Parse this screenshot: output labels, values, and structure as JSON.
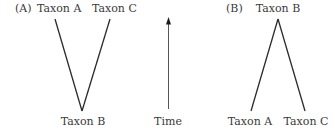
{
  "panel_a": {
    "label": "(A)",
    "top_left_taxon": "Taxon A",
    "top_right_taxon": "Taxon C",
    "bottom_taxon": "Taxon B"
  },
  "time_axis": {
    "label": "Time",
    "direction": "up"
  },
  "panel_b": {
    "label": "(B)",
    "top_taxon": "Taxon B",
    "bottom_left_taxon": "Taxon A",
    "bottom_right_taxon": "Taxon C"
  },
  "colors": {
    "line": "#2b2b2b",
    "text": "#3a3a3a",
    "background": "#ffffff"
  }
}
